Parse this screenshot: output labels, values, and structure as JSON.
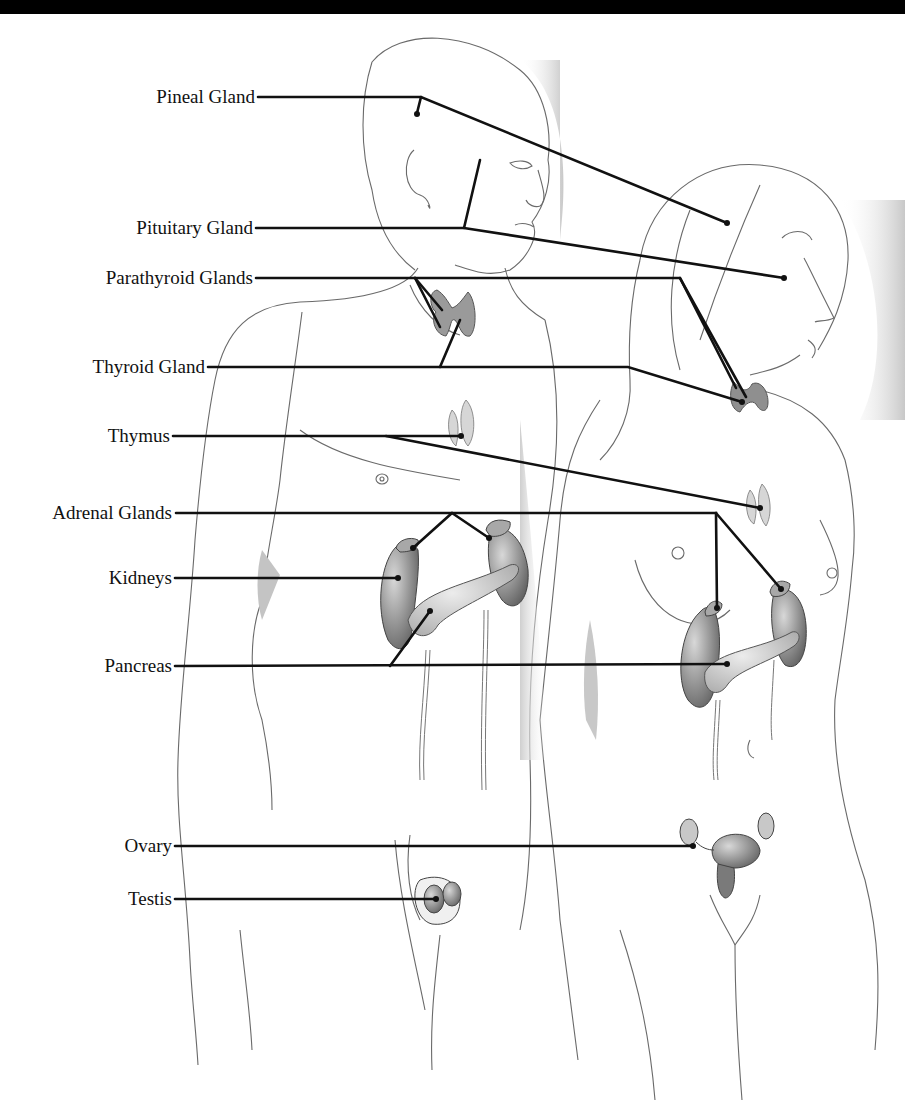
{
  "colors": {
    "background": "#ffffff",
    "top_band": "#000000",
    "leader_line": "#111111",
    "outline": "#555555",
    "shading": "#bdbdbd",
    "organ_fill": "#8a8a8a"
  },
  "labels": [
    {
      "id": "pineal",
      "text": "Pineal Gland",
      "x_right": 255,
      "y": 97
    },
    {
      "id": "pituitary",
      "text": "Pituitary Gland",
      "x_right": 253,
      "y": 228
    },
    {
      "id": "parathyroid",
      "text": "Parathyroid Glands",
      "x_right": 253,
      "y": 278
    },
    {
      "id": "thyroid",
      "text": "Thyroid Gland",
      "x_right": 205,
      "y": 367
    },
    {
      "id": "thymus",
      "text": "Thymus",
      "x_right": 170,
      "y": 436
    },
    {
      "id": "adrenal",
      "text": "Adrenal Glands",
      "x_right": 172,
      "y": 513
    },
    {
      "id": "kidneys",
      "text": "Kidneys",
      "x_right": 172,
      "y": 578
    },
    {
      "id": "pancreas",
      "text": "Pancreas",
      "x_right": 172,
      "y": 666
    },
    {
      "id": "ovary",
      "text": "Ovary",
      "x_right": 172,
      "y": 846
    },
    {
      "id": "testis",
      "text": "Testis",
      "x_right": 172,
      "y": 899
    }
  ],
  "figures": [
    {
      "id": "male-figure",
      "description": "Male body outline, front-facing torso, head in profile"
    },
    {
      "id": "female-figure",
      "description": "Female body outline, front-facing torso, head in profile"
    }
  ]
}
